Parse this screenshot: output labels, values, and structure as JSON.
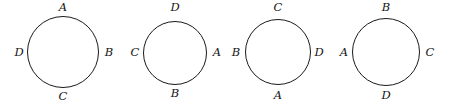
{
  "figure": {
    "background_color": "#ffffff",
    "stroke_color": "#1a1a1a",
    "label_color": "#151515",
    "width": 456,
    "height": 109
  },
  "circles": [
    {
      "name": "circle-1",
      "cx": 63,
      "cy": 52,
      "r": 36,
      "labels": {
        "top": "A",
        "right": "B",
        "bottom": "C",
        "left": "D"
      },
      "label_positions": {
        "top": {
          "x": 63,
          "y": 2
        },
        "right": {
          "x": 109,
          "y": 47
        },
        "bottom": {
          "x": 63,
          "y": 91
        },
        "left": {
          "x": 19,
          "y": 47
        }
      }
    },
    {
      "name": "circle-2",
      "cx": 175,
      "cy": 53,
      "r": 32,
      "labels": {
        "top": "D",
        "right": "A",
        "bottom": "B",
        "left": "C"
      },
      "label_positions": {
        "top": {
          "x": 175,
          "y": 2
        },
        "right": {
          "x": 217,
          "y": 47
        },
        "bottom": {
          "x": 175,
          "y": 88
        },
        "left": {
          "x": 135,
          "y": 47
        }
      }
    },
    {
      "name": "circle-3",
      "cx": 278,
      "cy": 52,
      "r": 33,
      "labels": {
        "top": "C",
        "right": "D",
        "bottom": "A",
        "left": "B"
      },
      "label_positions": {
        "top": {
          "x": 278,
          "y": 2
        },
        "right": {
          "x": 319,
          "y": 47
        },
        "bottom": {
          "x": 278,
          "y": 90
        },
        "left": {
          "x": 236,
          "y": 47
        }
      }
    },
    {
      "name": "circle-4",
      "cx": 386,
      "cy": 52,
      "r": 34,
      "labels": {
        "top": "B",
        "right": "C",
        "bottom": "D",
        "left": "A"
      },
      "label_positions": {
        "top": {
          "x": 386,
          "y": 2
        },
        "right": {
          "x": 430,
          "y": 47
        },
        "bottom": {
          "x": 386,
          "y": 90
        },
        "left": {
          "x": 344,
          "y": 47
        }
      }
    }
  ]
}
